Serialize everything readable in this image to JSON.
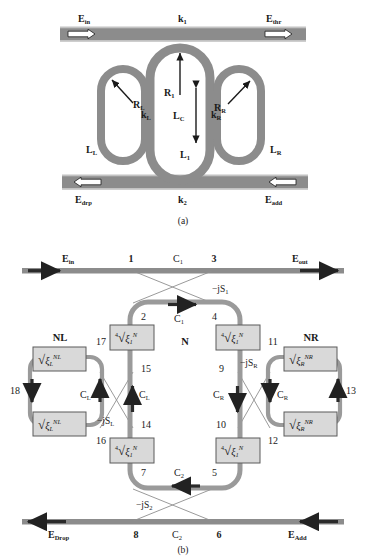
{
  "figure": {
    "panels": [
      {
        "id": "a",
        "caption": "(a)"
      },
      {
        "id": "b",
        "caption": "(b)"
      }
    ],
    "colors": {
      "waveguide": "#8c8c8c",
      "waveguide_light": "#b4b4b4",
      "box_fill": "#d9d9d9",
      "box_border": "#5a5a5a",
      "text": "#1a1a1a",
      "background": "#ffffff",
      "thin_line": "#8f8f8f"
    }
  },
  "panel_a": {
    "caption": "(a)",
    "ports": {
      "in": "E",
      "in_sub": "in",
      "thr": "E",
      "thr_sub": "thr",
      "drp": "E",
      "drp_sub": "drp",
      "add": "E",
      "add_sub": "add"
    },
    "labels": {
      "k1": "k",
      "k1_sub": "1",
      "k2": "k",
      "k2_sub": "2",
      "kL": "k",
      "kL_sub": "L",
      "kR": "k",
      "kR_sub": "R",
      "RL": "R",
      "RL_sub": "L",
      "R1": "R",
      "R1_sub": "1",
      "RR": "R",
      "RR_sub": "R",
      "LL": "L",
      "LL_sub": "L",
      "LC": "L",
      "LC_sub": "C",
      "L1": "L",
      "L1_sub": "1",
      "LR": "L",
      "LR_sub": "R"
    }
  },
  "panel_b": {
    "caption": "(b)",
    "ports": {
      "in": "E",
      "in_sub": "in",
      "out": "E",
      "out_sub": "out",
      "drop": "E",
      "drop_sub": "Drop",
      "add": "E",
      "add_sub": "Add"
    },
    "ring_names": {
      "center": "N",
      "left": "NL",
      "right": "NR"
    },
    "couplings": {
      "C1": "C",
      "C1_sub": "1",
      "C2": "C",
      "C2_sub": "2",
      "CL": "C",
      "CL_sub": "L",
      "CR": "C",
      "CR_sub": "R"
    },
    "scatter": {
      "S1": "−jS",
      "S1_sub": "1",
      "S2": "−jS",
      "S2_sub": "2",
      "SL": "−jS",
      "SL_sub": "L",
      "SR": "−jS",
      "SR_sub": "R"
    },
    "node_numbers": [
      "1",
      "2",
      "3",
      "4",
      "5",
      "6",
      "7",
      "8",
      "9",
      "10",
      "11",
      "12",
      "13",
      "14",
      "15",
      "16",
      "17",
      "18"
    ],
    "boxes": {
      "center": {
        "root_index": "4",
        "radical": "√",
        "base": "ξ",
        "sub": "1",
        "sup": "N",
        "count": 4
      },
      "left": {
        "root_index": "",
        "radical": "√",
        "base": "ξ",
        "sub": "L",
        "sup": "NL",
        "count": 2
      },
      "right": {
        "root_index": "",
        "radical": "√",
        "base": "ξ",
        "sub": "R",
        "sup": "NR",
        "count": 2
      }
    }
  }
}
